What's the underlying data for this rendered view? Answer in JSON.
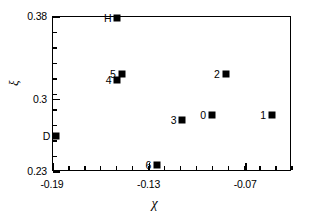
{
  "chart_data": {
    "type": "scatter",
    "title": "",
    "xlabel": "χ",
    "ylabel": "ξ",
    "xlim": [
      -0.19,
      -0.0415
    ],
    "ylim": [
      0.23,
      0.38
    ],
    "xticks": [
      "-0.19",
      "-0.13",
      "-0.07"
    ],
    "xtick_values": [
      -0.19,
      -0.13,
      -0.07
    ],
    "yticks": [
      "0.23",
      "0.3",
      "0.38"
    ],
    "ytick_values": [
      0.23,
      0.3,
      0.38
    ],
    "x_minor_count": 15,
    "y_minor_count": 10,
    "grid": false,
    "legend": false,
    "marker": "filled-square",
    "marker_color": "#000000",
    "points": [
      {
        "label": "H",
        "x": -0.15,
        "y": 0.379,
        "label_side": "left"
      },
      {
        "label": "5",
        "x": -0.1473,
        "y": 0.3245,
        "label_side": "left"
      },
      {
        "label": "4",
        "x": -0.15,
        "y": 0.3195,
        "label_side": "left"
      },
      {
        "label": "2",
        "x": -0.0827,
        "y": 0.3245,
        "label_side": "left"
      },
      {
        "label": "D",
        "x": -0.188,
        "y": 0.2645,
        "label_side": "left"
      },
      {
        "label": "3",
        "x": -0.1096,
        "y": 0.2805,
        "label_side": "left"
      },
      {
        "label": "0",
        "x": -0.0913,
        "y": 0.2855,
        "label_side": "left"
      },
      {
        "label": "1",
        "x": -0.054,
        "y": 0.2855,
        "label_side": "left"
      },
      {
        "label": "6",
        "x": -0.1253,
        "y": 0.237,
        "label_side": "left"
      }
    ]
  }
}
